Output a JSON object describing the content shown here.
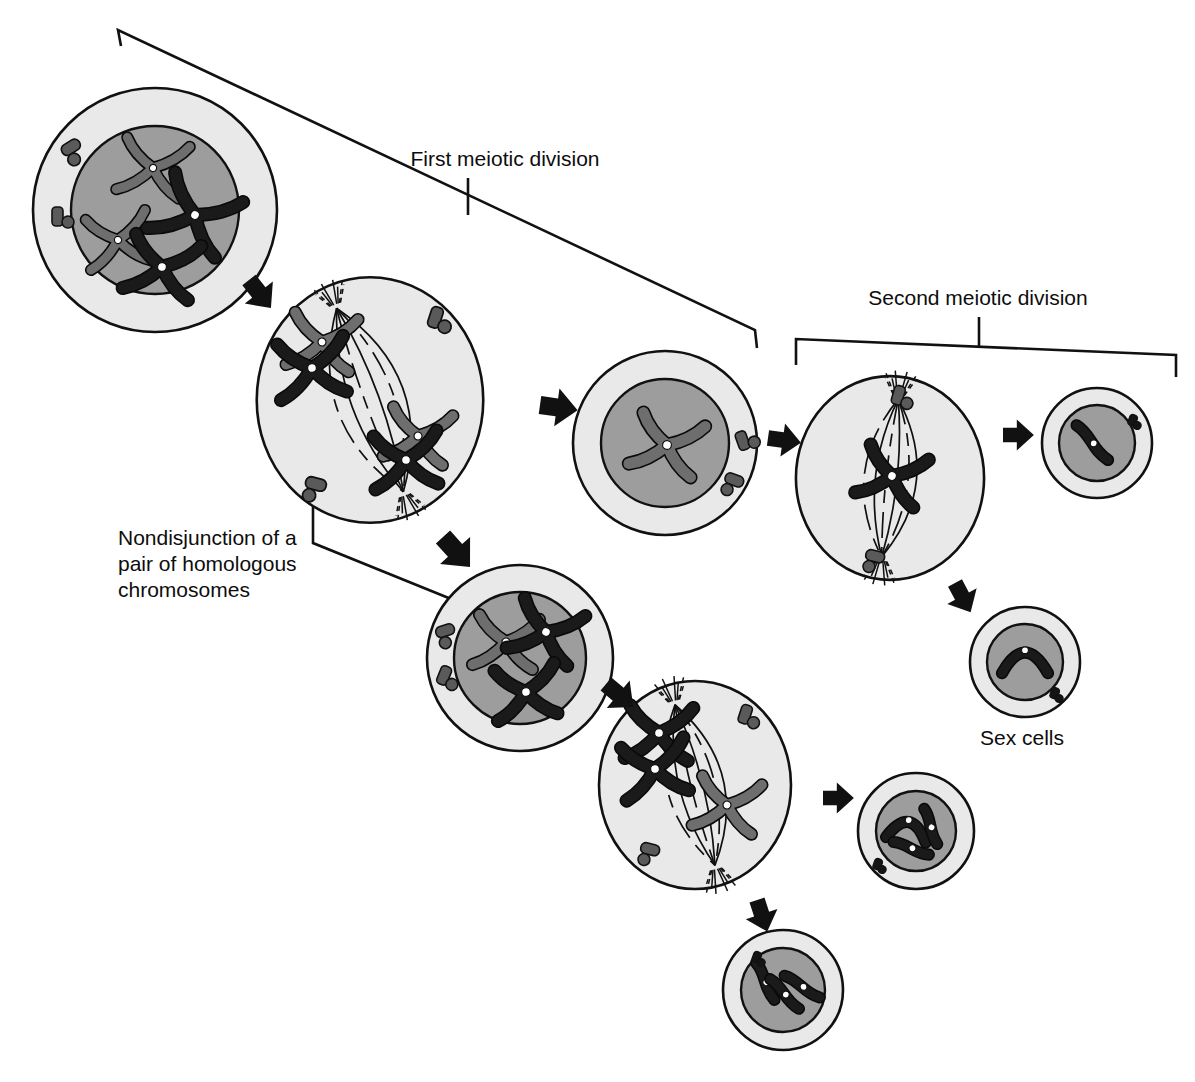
{
  "figure": {
    "title_visible": false,
    "background": "#ffffff"
  },
  "labels": {
    "first_division": "First meiotic division",
    "second_division": "Second meiotic division",
    "nondisjunction_line1": "Nondisjunction of a",
    "nondisjunction_line2": "pair of homologous",
    "nondisjunction_line3": "chromosomes",
    "sex_cells": "Sex cells"
  },
  "colors": {
    "outline": "#111111",
    "cytoplasm": "#e9e9e9",
    "nucleus": "#9d9d9d",
    "chromosome_dark": "#1a1a1a",
    "chromosome_gray": "#6e6e6e",
    "centromere": "#ffffff",
    "centriole": "#5a5a5a",
    "arrow": "#111111",
    "spindle": "#111111",
    "text": "#0d0d0d"
  },
  "cells": [
    {
      "id": "cell-1-prophase-i",
      "name": "parent-cell-prophase-i",
      "stage": "Prophase I",
      "cx": 155,
      "cy": 210,
      "r_cyto": 122,
      "r_nuc": 84,
      "nucleus_visible": true,
      "chromosome_count": 4,
      "dark_chromosomes": 2,
      "gray_chromosomes": 2,
      "centriole_pairs": 2,
      "spindle": false
    },
    {
      "id": "cell-2-metaphase-i",
      "name": "metaphase-i-cell",
      "stage": "Metaphase I",
      "cx": 370,
      "cy": 400,
      "r_cyto": 118,
      "r_nuc": 0,
      "nucleus_visible": false,
      "chromosome_count": 4,
      "dark_chromosomes": 2,
      "gray_chromosomes": 2,
      "centriole_pairs": 2,
      "spindle": true
    },
    {
      "id": "cell-3-normal-daughter",
      "name": "normal-daughter-cell",
      "stage": "Daughter cell (n)",
      "cx": 665,
      "cy": 443,
      "r_cyto": 92,
      "r_nuc": 64,
      "nucleus_visible": true,
      "chromosome_count": 1,
      "dark_chromosomes": 0,
      "gray_chromosomes": 1,
      "centriole_pairs": 2,
      "spindle": false
    },
    {
      "id": "cell-4-aneuploid-daughter",
      "name": "aneuploid-daughter-cell",
      "stage": "Daughter cell (n+1)",
      "cx": 520,
      "cy": 658,
      "r_cyto": 93,
      "r_nuc": 66,
      "nucleus_visible": true,
      "chromosome_count": 3,
      "dark_chromosomes": 2,
      "gray_chromosomes": 1,
      "centriole_pairs": 2,
      "spindle": false
    },
    {
      "id": "cell-5-metaphase-ii-top",
      "name": "metaphase-ii-cell-normal",
      "stage": "Metaphase II",
      "cx": 890,
      "cy": 478,
      "r_cyto": 98,
      "r_nuc": 0,
      "nucleus_visible": false,
      "chromosome_count": 1,
      "dark_chromosomes": 1,
      "gray_chromosomes": 0,
      "centriole_pairs": 2,
      "spindle": true
    },
    {
      "id": "cell-6-metaphase-ii-bottom",
      "name": "metaphase-ii-cell-aneuploid",
      "stage": "Metaphase II",
      "cx": 695,
      "cy": 785,
      "r_cyto": 100,
      "r_nuc": 0,
      "nucleus_visible": false,
      "chromosome_count": 3,
      "dark_chromosomes": 2,
      "gray_chromosomes": 1,
      "centriole_pairs": 2,
      "spindle": true
    },
    {
      "id": "gamete-1",
      "name": "sex-cell-normal-upper",
      "stage": "Sex cell",
      "cx": 1097,
      "cy": 443,
      "r_cyto": 55,
      "r_nuc": 38,
      "nucleus_visible": true,
      "chromosome_count": 1,
      "dark_chromosomes": 1,
      "gray_chromosomes": 0,
      "centriole_pairs": 1,
      "spindle": false
    },
    {
      "id": "gamete-2",
      "name": "sex-cell-normal-lower",
      "stage": "Sex cell",
      "cx": 1025,
      "cy": 662,
      "r_cyto": 55,
      "r_nuc": 38,
      "nucleus_visible": true,
      "chromosome_count": 1,
      "dark_chromosomes": 1,
      "gray_chromosomes": 0,
      "centriole_pairs": 1,
      "spindle": false
    },
    {
      "id": "gamete-3",
      "name": "sex-cell-extra-chromosome",
      "stage": "Sex cell (n+1)",
      "cx": 916,
      "cy": 831,
      "r_cyto": 58,
      "r_nuc": 40,
      "nucleus_visible": true,
      "chromosome_count": 3,
      "dark_chromosomes": 3,
      "gray_chromosomes": 0,
      "centriole_pairs": 1,
      "spindle": false
    },
    {
      "id": "gamete-4",
      "name": "sex-cell-missing-chromosome",
      "stage": "Sex cell (n-1)",
      "cx": 783,
      "cy": 990,
      "r_cyto": 60,
      "r_nuc": 42,
      "nucleus_visible": true,
      "chromosome_count": 3,
      "dark_chromosomes": 3,
      "gray_chromosomes": 0,
      "centriole_pairs": 1,
      "spindle": false
    }
  ],
  "brackets": [
    {
      "id": "bracket-first-division",
      "name": "first-meiotic-division-bracket",
      "label": "First meiotic division",
      "label_x": 505,
      "label_y": 166,
      "tick_x": 468,
      "tick_y1": 178,
      "tick_y2": 215,
      "path": "M 121,46 L 118,30 L 755,330 L 757,348"
    },
    {
      "id": "bracket-second-division",
      "name": "second-meiotic-division-bracket",
      "label": "Second meiotic division",
      "label_x": 978,
      "label_y": 305,
      "tick_x": 979,
      "tick_y1": 317,
      "tick_y2": 348,
      "path": "M 796,365 L 796,339 L 1176,355 L 1176,377"
    }
  ],
  "leaders": [
    {
      "id": "leader-nondisjunction",
      "name": "nondisjunction-leader-line",
      "path": "M 313,480 L 313,543 L 461,603"
    }
  ],
  "arrows": [
    {
      "id": "arrow-1",
      "name": "arrow-prophase-to-metaphase",
      "x": 249,
      "y": 280,
      "angle": 52,
      "size": 30
    },
    {
      "id": "arrow-2",
      "name": "arrow-metaphase-to-daughter",
      "x": 540,
      "y": 405,
      "angle": 8,
      "size": 32
    },
    {
      "id": "arrow-3",
      "name": "arrow-metaphase-to-aneuploid",
      "x": 443,
      "y": 537,
      "angle": 48,
      "size": 34
    },
    {
      "id": "arrow-4",
      "name": "arrow-daughter-to-metaphase-ii",
      "x": 768,
      "y": 438,
      "angle": 8,
      "size": 28
    },
    {
      "id": "arrow-5",
      "name": "arrow-aneuploid-to-metaphase-ii",
      "x": 606,
      "y": 684,
      "angle": 40,
      "size": 30
    },
    {
      "id": "arrow-6",
      "name": "arrow-metaphase-ii-to-gamete-1",
      "x": 1003,
      "y": 435,
      "angle": 0,
      "size": 26
    },
    {
      "id": "arrow-7",
      "name": "arrow-metaphase-ii-to-gamete-2",
      "x": 955,
      "y": 583,
      "angle": 62,
      "size": 28
    },
    {
      "id": "arrow-8",
      "name": "arrow-metaphase-ii-to-gamete-3",
      "x": 823,
      "y": 798,
      "angle": 0,
      "size": 26
    },
    {
      "id": "arrow-9",
      "name": "arrow-metaphase-ii-to-gamete-4",
      "x": 757,
      "y": 900,
      "angle": 72,
      "size": 28
    }
  ],
  "legend_note": {
    "sex_cells_label_x": 1022,
    "sex_cells_label_y": 745
  }
}
